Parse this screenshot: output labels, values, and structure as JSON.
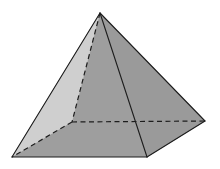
{
  "figure": {
    "shape_name": "square-pyramid",
    "caption": "",
    "background_color": "#ffffff",
    "canvas": {
      "width": 220,
      "height": 169
    }
  },
  "geometry": {
    "vertices": {
      "apex": {
        "label": "apex",
        "x": 100,
        "y": 13
      },
      "base_left": {
        "label": "base-left-corner",
        "x": 12,
        "y": 157
      },
      "base_front": {
        "label": "base-front-corner",
        "x": 147,
        "y": 157
      },
      "base_right": {
        "label": "base-right-corner",
        "x": 205,
        "y": 121
      },
      "base_back": {
        "label": "base-back-corner",
        "x": 72,
        "y": 122
      }
    },
    "faces": [
      {
        "name": "left-lateral-face",
        "points": "100,13 12,157 72,122",
        "fill": "#cfcfcf",
        "visible": true
      },
      {
        "name": "front-left-lateral-face",
        "points": "100,13 12,157 147,157",
        "fill": "#9e9e9e",
        "visible": true
      },
      {
        "name": "front-right-lateral-face",
        "points": "100,13 147,157 205,121",
        "fill": "#9a9a9a",
        "visible": true
      },
      {
        "name": "base-face",
        "points": "12,157 147,157 205,121 72,122",
        "fill": "#b7b7b7",
        "visible": true
      }
    ],
    "solid_edges": [
      {
        "name": "edge-apex-to-base-left",
        "x1": 100,
        "y1": 13,
        "x2": 12,
        "y2": 157
      },
      {
        "name": "edge-apex-to-base-front",
        "x1": 100,
        "y1": 13,
        "x2": 147,
        "y2": 157
      },
      {
        "name": "edge-apex-to-base-right",
        "x1": 100,
        "y1": 13,
        "x2": 205,
        "y2": 121
      },
      {
        "name": "edge-base-left-to-front",
        "x1": 12,
        "y1": 157,
        "x2": 147,
        "y2": 157
      },
      {
        "name": "edge-base-front-to-right",
        "x1": 147,
        "y1": 157,
        "x2": 205,
        "y2": 121
      }
    ],
    "dashed_edges": [
      {
        "name": "hidden-edge-apex-to-base-back",
        "x1": 100,
        "y1": 13,
        "x2": 72,
        "y2": 122
      },
      {
        "name": "hidden-edge-base-back-to-left",
        "x1": 72,
        "y1": 122,
        "x2": 12,
        "y2": 157
      },
      {
        "name": "hidden-edge-base-back-to-right",
        "x1": 72,
        "y1": 122,
        "x2": 205,
        "y2": 121
      }
    ]
  },
  "style": {
    "stroke_color": "#1d1d1d",
    "stroke_width": "1.1",
    "dash_pattern": "5,3.5",
    "dashed_stroke_width": "1.2"
  },
  "labels": {
    "vertex_labels": [],
    "edge_labels": [],
    "annotations": []
  }
}
